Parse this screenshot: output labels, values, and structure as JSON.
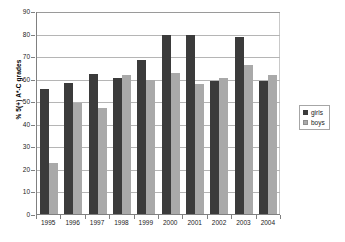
{
  "chart_data": {
    "type": "bar",
    "title": "",
    "xlabel": "",
    "ylabel": "% 5(+) A*-C grades",
    "ylim": [
      0,
      90
    ],
    "yticks": [
      0,
      10,
      20,
      30,
      40,
      50,
      60,
      70,
      80,
      90
    ],
    "grid": true,
    "legend_position": "right",
    "categories": [
      "1995",
      "1996",
      "1997",
      "1998",
      "1999",
      "2000",
      "2001",
      "2002",
      "2003",
      "2004"
    ],
    "series": [
      {
        "name": "girls",
        "color": "#3b3b3b",
        "values": [
          55.5,
          58.0,
          62.0,
          60.5,
          68.5,
          79.5,
          79.5,
          59.0,
          78.5,
          59.0
        ]
      },
      {
        "name": "boys",
        "color": "#a9a9a9",
        "values": [
          22.5,
          49.0,
          47.0,
          61.5,
          59.5,
          62.5,
          57.5,
          60.5,
          66.0,
          61.5
        ]
      }
    ]
  },
  "legend": {
    "items": [
      {
        "label": "girls",
        "swatch": "legend-swatch-girls"
      },
      {
        "label": "boys",
        "swatch": "legend-swatch-boys"
      }
    ]
  }
}
